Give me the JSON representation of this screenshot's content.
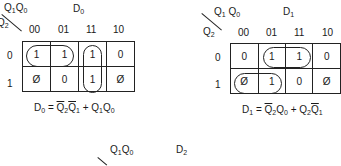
{
  "maps": [
    {
      "id": "D0",
      "title": "D",
      "title_sub": "0",
      "col_var": "Q1Q0",
      "row_var": "Q2",
      "col_headers": [
        "00",
        "01",
        "11",
        "10"
      ],
      "row_headers": [
        "0",
        "1"
      ],
      "cells": [
        [
          "1",
          "1",
          "1",
          "0"
        ],
        [
          "Ø",
          "0",
          "1",
          "Ø"
        ]
      ],
      "groups": [
        "row0 cols 00-01",
        "col 11 rows 0-1"
      ],
      "equation": "D0 = Q̄2 Q̄1 + Q1 Q0"
    },
    {
      "id": "D1",
      "title": "D",
      "title_sub": "1",
      "col_var": "Q1Q0",
      "row_var": "Q2",
      "col_headers": [
        "00",
        "01",
        "11",
        "10"
      ],
      "row_headers": [
        "0",
        "1"
      ],
      "cells": [
        [
          "0",
          "1",
          "1",
          "0"
        ],
        [
          "Ø",
          "1",
          "0",
          "Ø"
        ]
      ],
      "groups": [
        "row0 cols 01-11",
        "row1 cols 00-01"
      ],
      "equation": "D1 = Q̄2 Q0 + Q2 Q̄1"
    },
    {
      "id": "D2",
      "title": "D",
      "title_sub": "2",
      "col_var": "Q1Q0"
    }
  ],
  "labels": {
    "q": "Q",
    "d": "D",
    "eq_sign": "=",
    "plus": "+",
    "s0": "0",
    "s1": "1",
    "s2": "2"
  }
}
